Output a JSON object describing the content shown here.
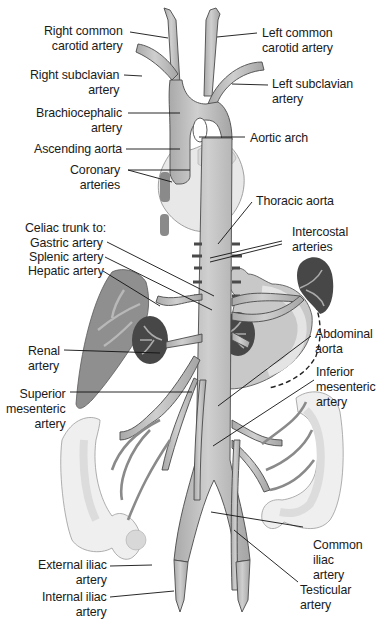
{
  "diagram": {
    "type": "anatomical-illustration",
    "colors": {
      "artery_fill": "#b9b9b9",
      "artery_stroke": "#4a4a4a",
      "heart_fill": "#e6e6e6",
      "liver_fill": "#8e8e8e",
      "kidney_fill": "#4a4a4a",
      "stomach_fill": "#c9c9c9",
      "intestine_fill": "#eeeeee",
      "leader_line": "#111111",
      "text": "#1a1a1a",
      "background": "#ffffff"
    },
    "labels": {
      "right_common_carotid": "Right common\ncarotid artery",
      "left_common_carotid": "Left common\ncarotid artery",
      "right_subclavian": "Right subclavian\nartery",
      "left_subclavian": "Left subclavian\nartery",
      "brachiocephalic": "Brachiocephalic\nartery",
      "aortic_arch": "Aortic arch",
      "ascending_aorta": "Ascending aorta",
      "coronary": "Coronary\narteries",
      "thoracic_aorta": "Thoracic aorta",
      "celiac_trunk": "Celiac trunk to:",
      "gastric": "Gastric artery",
      "splenic": "Splenic artery",
      "hepatic": "Hepatic artery",
      "intercostal": "Intercostal\narteries",
      "renal": "Renal\nartery",
      "abdominal_aorta": "Abdominal\naorta",
      "superior_mesenteric": "Superior\nmesenteric\nartery",
      "inferior_mesenteric": "Inferior\nmesenteric\nartery",
      "common_iliac": "Common\niliac\nartery",
      "external_iliac": "External iliac\nartery",
      "internal_iliac": "Internal iliac\nartery",
      "testicular": "Testicular\nartery"
    }
  }
}
